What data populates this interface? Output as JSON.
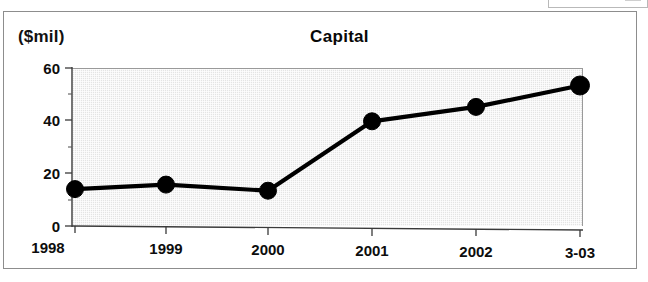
{
  "figure": {
    "title": "Capital",
    "y_axis_unit": "($mil)"
  },
  "chart_data": {
    "type": "line",
    "title": "Capital",
    "xlabel": "",
    "ylabel": "($mil)",
    "categories": [
      "1998",
      "1999",
      "2000",
      "2001",
      "2002",
      "3-03"
    ],
    "values": [
      14,
      16,
      14,
      40,
      45.5,
      53.5
    ],
    "series": [
      {
        "name": "Capital",
        "values": [
          14,
          16,
          14,
          40,
          45.5,
          53.5
        ]
      }
    ],
    "ylim": [
      0,
      60
    ],
    "y_ticks": [
      0,
      20,
      40,
      60
    ],
    "y_tick_labels": [
      "0",
      "20",
      "40",
      "60"
    ],
    "y_minor_ticks": [
      10,
      30,
      50
    ],
    "x_tick_labels": [
      "1998",
      "1999",
      "2000",
      "2001",
      "2002",
      "3-03"
    ],
    "grid": false,
    "legend": "none",
    "plot_background_color": "#e4e4e4",
    "line_color": "#000000",
    "marker_color": "#000000"
  },
  "y_ticks": {
    "t0": "0",
    "t1": "20",
    "t2": "40",
    "t3": "60"
  },
  "x_ticks": {
    "t0": "1998",
    "t1": "1999",
    "t2": "2000",
    "t3": "2001",
    "t4": "2002",
    "t5": "3-03"
  }
}
